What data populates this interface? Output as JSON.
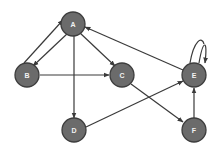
{
  "diagram": {
    "type": "directed-graph",
    "nodes": [
      {
        "id": "A",
        "label": "A",
        "x": 73,
        "y": 24
      },
      {
        "id": "B",
        "label": "B",
        "x": 27,
        "y": 75
      },
      {
        "id": "C",
        "label": "C",
        "x": 122,
        "y": 75
      },
      {
        "id": "D",
        "label": "D",
        "x": 74,
        "y": 130
      },
      {
        "id": "E",
        "label": "E",
        "x": 194,
        "y": 75
      },
      {
        "id": "F",
        "label": "F",
        "x": 194,
        "y": 130
      }
    ],
    "edges": [
      {
        "from": "B",
        "to": "A",
        "directed": true
      },
      {
        "from": "A",
        "to": "B",
        "directed": true
      },
      {
        "from": "A",
        "to": "C",
        "directed": true
      },
      {
        "from": "A",
        "to": "D",
        "directed": true
      },
      {
        "from": "E",
        "to": "A",
        "directed": true
      },
      {
        "from": "B",
        "to": "C",
        "directed": true
      },
      {
        "from": "C",
        "to": "F",
        "directed": true
      },
      {
        "from": "D",
        "to": "E",
        "directed": true
      },
      {
        "from": "F",
        "to": "E",
        "directed": true
      },
      {
        "from": "E",
        "to": "E",
        "directed": true,
        "self_loop": true
      }
    ],
    "colors": {
      "node_fill": "#6b6b6b",
      "node_stroke": "#3d3d3d",
      "edge": "#3a3a3a",
      "label": "#f2f2f2",
      "background": "#ffffff"
    }
  }
}
